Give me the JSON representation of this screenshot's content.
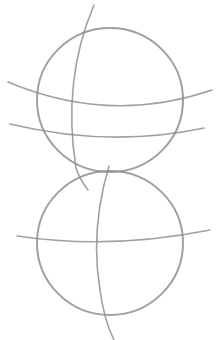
{
  "image": {
    "description": "Pencil sketch of two stacked circles with curved construction guide lines",
    "background": "#ffffff",
    "stroke_color": "#8f8f8f"
  },
  "shapes": {
    "top_circle": {
      "cx": 110,
      "cy": 100,
      "r": 73
    },
    "bottom_circle": {
      "cx": 110,
      "cy": 243,
      "r": 73
    }
  }
}
